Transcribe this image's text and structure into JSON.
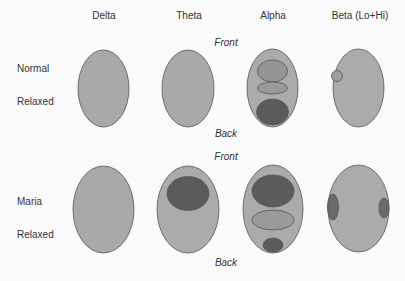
{
  "columns": [
    "Delta",
    "Theta",
    "Alpha",
    "Beta (Lo+Hi)"
  ],
  "rows": [
    {
      "label_line1": "Normal",
      "label_line2": "Relaxed",
      "front": "Front",
      "back": "Back"
    },
    {
      "label_line1": "Maria",
      "label_line2": "Relaxed",
      "front": "Front",
      "back": "Back"
    }
  ],
  "colors": {
    "head_fill": "#a9a9a9",
    "outline": "#555555",
    "dark": "#5b5b5b",
    "medium": "#8e8e8e",
    "background": "#fbfbfb"
  }
}
